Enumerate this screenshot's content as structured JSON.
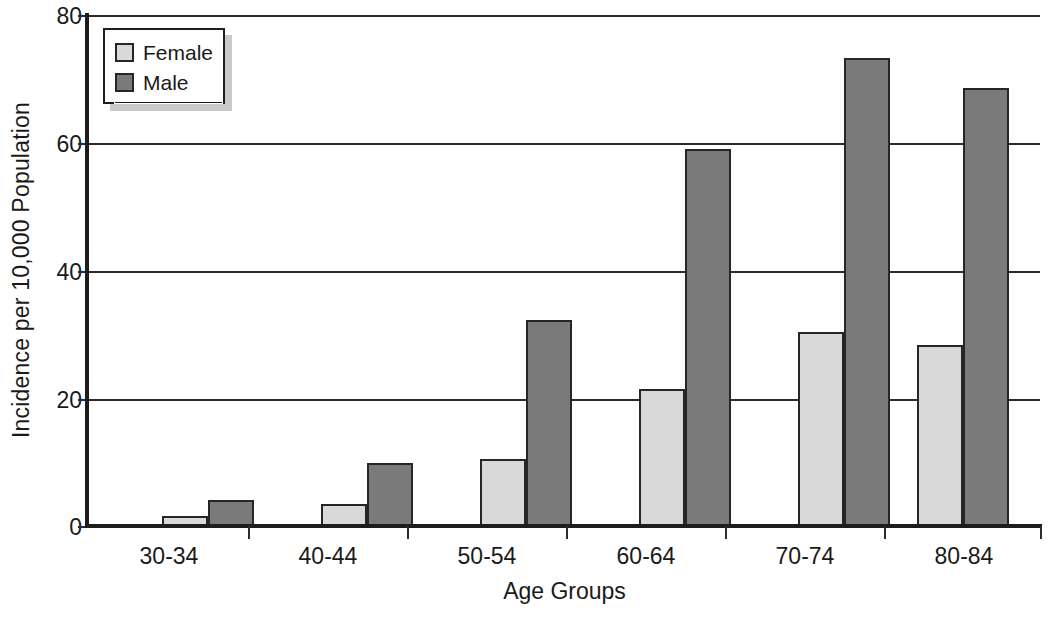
{
  "chart_data": {
    "type": "bar",
    "title": "",
    "xlabel": "Age Groups",
    "ylabel": "Incidence per 10,000 Population",
    "categories": [
      "30-34",
      "40-44",
      "50-54",
      "60-64",
      "70-74",
      "80-84"
    ],
    "series": [
      {
        "name": "Female",
        "color": "#d9d9d9",
        "values": [
          1.6,
          3.5,
          10.5,
          21.4,
          30.4,
          28.4
        ]
      },
      {
        "name": "Male",
        "color": "#7a7a7a",
        "values": [
          4.0,
          9.8,
          32.3,
          59.0,
          73.3,
          68.6
        ]
      }
    ],
    "ylim": [
      0,
      80
    ],
    "yticks": [
      0,
      20,
      40,
      60,
      80
    ],
    "ytick_labels": [
      "0",
      "20",
      "40",
      "60",
      "80"
    ],
    "grid": true,
    "grid_axis": "y",
    "legend_position": "top-left",
    "legend_entries": [
      "Female",
      "Male"
    ]
  }
}
